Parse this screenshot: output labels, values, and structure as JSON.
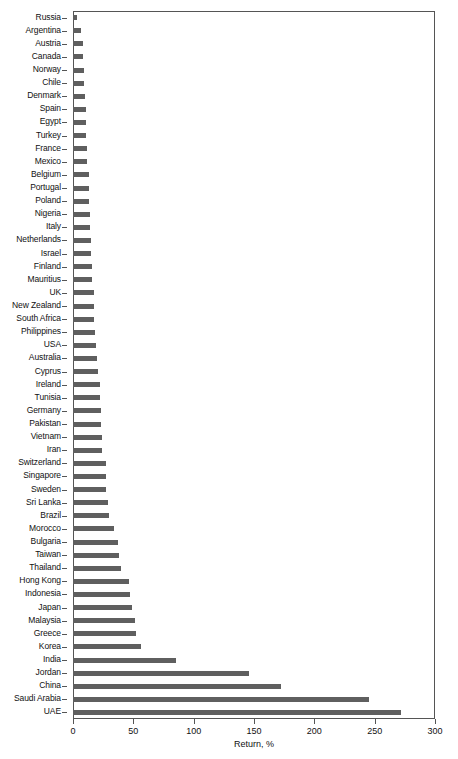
{
  "chart_data": {
    "type": "bar",
    "orientation": "horizontal",
    "title": "",
    "xlabel": "Return, %",
    "ylabel": "",
    "xlim": [
      0,
      300
    ],
    "xticks": [
      0,
      50,
      100,
      150,
      200,
      250,
      300
    ],
    "grid": false,
    "legend": null,
    "bar_color": "#5f5f5f",
    "axis_color": "#555555",
    "categories": [
      "Russia",
      "Argentina",
      "Austria",
      "Canada",
      "Norway",
      "Chile",
      "Denmark",
      "Spain",
      "Egypt",
      "Turkey",
      "France",
      "Mexico",
      "Belgium",
      "Portugal",
      "Poland",
      "Nigeria",
      "Italy",
      "Netherlands",
      "Israel",
      "Finland",
      "Mauritius",
      "UK",
      "New Zealand",
      "South Africa",
      "Philippines",
      "USA",
      "Australia",
      "Cyprus",
      "Ireland",
      "Tunisia",
      "Germany",
      "Pakistan",
      "Vietnam",
      "Iran",
      "Switzerland",
      "Singapore",
      "Sweden",
      "Sri Lanka",
      "Brazil",
      "Morocco",
      "Bulgaria",
      "Taiwan",
      "Thailand",
      "Hong Kong",
      "Indonesia",
      "Japan",
      "Malaysia",
      "Greece",
      "Korea",
      "India",
      "Jordan",
      "China",
      "Saudi Arabia",
      "UAE"
    ],
    "values": [
      3,
      7,
      8,
      8,
      9,
      9,
      10,
      11,
      11,
      11,
      12,
      12,
      13,
      13,
      13,
      14,
      14,
      15,
      15,
      16,
      16,
      17,
      17,
      17,
      18,
      19,
      20,
      21,
      22,
      22,
      23,
      23,
      24,
      24,
      27,
      27,
      27,
      29,
      30,
      34,
      37,
      38,
      40,
      46,
      47,
      49,
      51,
      52,
      56,
      85,
      146,
      172,
      245,
      272
    ]
  }
}
